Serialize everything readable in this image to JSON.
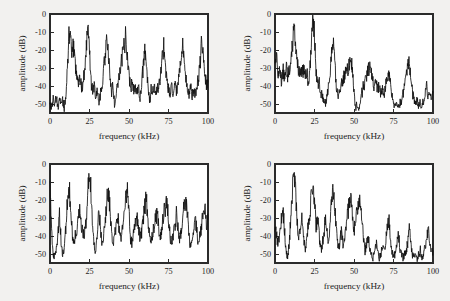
{
  "figure": {
    "background_color": "#f2f1ef",
    "panel_count": 4,
    "layout": "2x2-grid"
  },
  "axes": {
    "xlabel": "frequency (kHz)",
    "ylabel": "amplitude (dB)",
    "xticks": [
      "0",
      "25",
      "50",
      "75",
      "100"
    ],
    "xtick_values": [
      0,
      25,
      50,
      75,
      100
    ],
    "yticks": [
      "0",
      "-10",
      "-20",
      "-30",
      "-40",
      "-50"
    ],
    "ytick_values": [
      0,
      -10,
      -20,
      -30,
      -40,
      -50
    ],
    "xlim": [
      0,
      100
    ],
    "ylim": [
      -55,
      0
    ],
    "frame_color": "#2b2b2b",
    "trace_color": "#111111"
  },
  "chart_data": [
    {
      "type": "line",
      "title": "",
      "panel": "top-left",
      "xlabel": "frequency (kHz)",
      "ylabel": "amplitude (dB)",
      "xlim": [
        0,
        100
      ],
      "ylim": [
        -55,
        0
      ],
      "grid": false,
      "legend": "none",
      "peaks": [
        {
          "x": 12,
          "y": -10.5
        },
        {
          "x": 24,
          "y": 0
        },
        {
          "x": 36,
          "y": -14
        },
        {
          "x": 48,
          "y": -12
        },
        {
          "x": 60,
          "y": -20
        },
        {
          "x": 72,
          "y": -17
        },
        {
          "x": 84,
          "y": -18
        },
        {
          "x": 96,
          "y": -15
        }
      ],
      "noise_floor": -44,
      "x": [
        0,
        1,
        2,
        3,
        4,
        5,
        6,
        7,
        8,
        9,
        10,
        11,
        12,
        13,
        14,
        15,
        16,
        17,
        18,
        19,
        20,
        21,
        22,
        23,
        24,
        25,
        26,
        27,
        28,
        29,
        30,
        31,
        32,
        33,
        34,
        35,
        36,
        37,
        38,
        39,
        40,
        41,
        42,
        43,
        44,
        45,
        46,
        47,
        48,
        49,
        50,
        51,
        52,
        53,
        54,
        55,
        56,
        57,
        58,
        59,
        60,
        61,
        62,
        63,
        64,
        65,
        66,
        67,
        68,
        69,
        70,
        71,
        72,
        73,
        74,
        75,
        76,
        77,
        78,
        79,
        80,
        81,
        82,
        83,
        84,
        85,
        86,
        87,
        88,
        89,
        90,
        91,
        92,
        93,
        94,
        95,
        96,
        97,
        98,
        99,
        100
      ],
      "values": [
        -49,
        -52,
        -47,
        -50,
        -46,
        -52,
        -47,
        -51,
        -48,
        -53,
        -45,
        -30,
        -10.5,
        -17,
        -22,
        -18,
        -28,
        -33,
        -38,
        -36,
        -41,
        -38,
        -30,
        -18,
        0,
        -22,
        -38,
        -42,
        -40,
        -46,
        -42,
        -50,
        -44,
        -39,
        -30,
        -22,
        -14,
        -24,
        -34,
        -43,
        -40,
        -52,
        -43,
        -38,
        -33,
        -28,
        -22,
        -18,
        -12,
        -22,
        -34,
        -41,
        -38,
        -43,
        -40,
        -44,
        -41,
        -47,
        -38,
        -30,
        -20,
        -30,
        -38,
        -50,
        -42,
        -44,
        -40,
        -45,
        -42,
        -40,
        -34,
        -24,
        -17,
        -28,
        -38,
        -42,
        -45,
        -41,
        -44,
        -40,
        -43,
        -40,
        -33,
        -24,
        -18,
        -26,
        -36,
        -42,
        -44,
        -41,
        -45,
        -42,
        -44,
        -40,
        -36,
        -28,
        -15,
        -24,
        -34,
        -39,
        -38
      ]
    },
    {
      "type": "line",
      "title": "",
      "panel": "top-right",
      "xlabel": "frequency (kHz)",
      "ylabel": "amplitude (dB)",
      "xlim": [
        0,
        100
      ],
      "ylim": [
        -55,
        0
      ],
      "grid": false,
      "legend": "none",
      "peaks": [
        {
          "x": 12,
          "y": -6
        },
        {
          "x": 24,
          "y": 0
        },
        {
          "x": 37,
          "y": -18
        },
        {
          "x": 48,
          "y": -24
        },
        {
          "x": 60,
          "y": -30
        },
        {
          "x": 72,
          "y": -32
        },
        {
          "x": 85,
          "y": -28
        }
      ],
      "noise_floor": -46,
      "x": [
        0,
        1,
        2,
        3,
        4,
        5,
        6,
        7,
        8,
        9,
        10,
        11,
        12,
        13,
        14,
        15,
        16,
        17,
        18,
        19,
        20,
        21,
        22,
        23,
        24,
        25,
        26,
        27,
        28,
        29,
        30,
        31,
        32,
        33,
        34,
        35,
        36,
        37,
        38,
        39,
        40,
        41,
        42,
        43,
        44,
        45,
        46,
        47,
        48,
        49,
        50,
        51,
        52,
        53,
        54,
        55,
        56,
        57,
        58,
        59,
        60,
        61,
        62,
        63,
        64,
        65,
        66,
        67,
        68,
        69,
        70,
        71,
        72,
        73,
        74,
        75,
        76,
        77,
        78,
        79,
        80,
        81,
        82,
        83,
        84,
        85,
        86,
        87,
        88,
        89,
        90,
        91,
        92,
        93,
        94,
        95,
        96,
        97,
        98,
        99,
        100
      ],
      "values": [
        -31,
        -24,
        -32,
        -29,
        -37,
        -31,
        -35,
        -30,
        -34,
        -31,
        -29,
        -17,
        -6,
        -17,
        -28,
        -32,
        -30,
        -33,
        -31,
        -35,
        -32,
        -37,
        -33,
        -14,
        0,
        -12,
        -30,
        -40,
        -38,
        -44,
        -46,
        -48,
        -50,
        -45,
        -40,
        -30,
        -22,
        -18,
        -30,
        -42,
        -46,
        -42,
        -38,
        -36,
        -34,
        -33,
        -31,
        -28,
        -24,
        -32,
        -44,
        -52,
        -50,
        -53,
        -48,
        -44,
        -40,
        -38,
        -34,
        -31,
        -30,
        -34,
        -38,
        -40,
        -38,
        -42,
        -40,
        -44,
        -41,
        -45,
        -40,
        -36,
        -32,
        -38,
        -44,
        -50,
        -52,
        -50,
        -53,
        -50,
        -48,
        -44,
        -40,
        -34,
        -30,
        -28,
        -36,
        -44,
        -48,
        -50,
        -48,
        -51,
        -49,
        -52,
        -48,
        -44,
        -40,
        -46,
        -42,
        -48,
        -44
      ]
    },
    {
      "type": "line",
      "title": "",
      "panel": "bottom-left",
      "xlabel": "frequency (kHz)",
      "ylabel": "amplitude (dB)",
      "xlim": [
        0,
        100
      ],
      "ylim": [
        -55,
        0
      ],
      "grid": false,
      "legend": "none",
      "peaks": [
        {
          "x": 0,
          "y": -9
        },
        {
          "x": 6,
          "y": -28
        },
        {
          "x": 12,
          "y": -10.5
        },
        {
          "x": 19,
          "y": -24
        },
        {
          "x": 25,
          "y": -2
        },
        {
          "x": 31,
          "y": -26
        },
        {
          "x": 37,
          "y": -13
        },
        {
          "x": 43,
          "y": -29
        },
        {
          "x": 49,
          "y": -16
        },
        {
          "x": 55,
          "y": -27
        },
        {
          "x": 61,
          "y": -19
        },
        {
          "x": 68,
          "y": -28
        },
        {
          "x": 74,
          "y": -20
        },
        {
          "x": 80,
          "y": -28
        },
        {
          "x": 86,
          "y": -19
        },
        {
          "x": 92,
          "y": -30
        },
        {
          "x": 98,
          "y": -25
        }
      ],
      "noise_floor": -40,
      "x": [
        0,
        1,
        2,
        3,
        4,
        5,
        6,
        7,
        8,
        9,
        10,
        11,
        12,
        13,
        14,
        15,
        16,
        17,
        18,
        19,
        20,
        21,
        22,
        23,
        24,
        25,
        26,
        27,
        28,
        29,
        30,
        31,
        32,
        33,
        34,
        35,
        36,
        37,
        38,
        39,
        40,
        41,
        42,
        43,
        44,
        45,
        46,
        47,
        48,
        49,
        50,
        51,
        52,
        53,
        54,
        55,
        56,
        57,
        58,
        59,
        60,
        61,
        62,
        63,
        64,
        65,
        66,
        67,
        68,
        69,
        70,
        71,
        72,
        73,
        74,
        75,
        76,
        77,
        78,
        79,
        80,
        81,
        82,
        83,
        84,
        85,
        86,
        87,
        88,
        89,
        90,
        91,
        92,
        93,
        94,
        95,
        96,
        97,
        98,
        99,
        100
      ],
      "values": [
        -9,
        -38,
        -50,
        -52,
        -48,
        -40,
        -28,
        -42,
        -50,
        -46,
        -36,
        -22,
        -10.5,
        -24,
        -38,
        -44,
        -40,
        -36,
        -30,
        -24,
        -34,
        -40,
        -38,
        -30,
        -14,
        -2,
        -16,
        -34,
        -46,
        -50,
        -38,
        -26,
        -36,
        -44,
        -40,
        -30,
        -20,
        -13,
        -26,
        -38,
        -44,
        -40,
        -34,
        -29,
        -38,
        -42,
        -36,
        -28,
        -20,
        -16,
        -28,
        -42,
        -44,
        -38,
        -32,
        -27,
        -36,
        -42,
        -38,
        -30,
        -24,
        -19,
        -30,
        -40,
        -43,
        -38,
        -34,
        -30,
        -28,
        -38,
        -40,
        -34,
        -28,
        -24,
        -20,
        -30,
        -40,
        -44,
        -40,
        -34,
        -28,
        -36,
        -42,
        -38,
        -28,
        -22,
        -19,
        -28,
        -40,
        -46,
        -44,
        -38,
        -30,
        -38,
        -44,
        -40,
        -34,
        -28,
        -25,
        -34,
        -31
      ]
    },
    {
      "type": "line",
      "title": "",
      "panel": "bottom-right",
      "xlabel": "frequency (kHz)",
      "ylabel": "amplitude (dB)",
      "xlim": [
        0,
        100
      ],
      "ylim": [
        -55,
        0
      ],
      "grid": false,
      "legend": "none",
      "peaks": [
        {
          "x": 12,
          "y": -2
        },
        {
          "x": 24,
          "y": -10
        },
        {
          "x": 37,
          "y": -14
        },
        {
          "x": 48,
          "y": -18
        },
        {
          "x": 54,
          "y": -22
        },
        {
          "x": 72,
          "y": -30
        },
        {
          "x": 78,
          "y": -38
        },
        {
          "x": 85,
          "y": -36
        },
        {
          "x": 97,
          "y": -35
        }
      ],
      "noise_floor": -48,
      "x": [
        0,
        1,
        2,
        3,
        4,
        5,
        6,
        7,
        8,
        9,
        10,
        11,
        12,
        13,
        14,
        15,
        16,
        17,
        18,
        19,
        20,
        21,
        22,
        23,
        24,
        25,
        26,
        27,
        28,
        29,
        30,
        31,
        32,
        33,
        34,
        35,
        36,
        37,
        38,
        39,
        40,
        41,
        42,
        43,
        44,
        45,
        46,
        47,
        48,
        49,
        50,
        51,
        52,
        53,
        54,
        55,
        56,
        57,
        58,
        59,
        60,
        61,
        62,
        63,
        64,
        65,
        66,
        67,
        68,
        69,
        70,
        71,
        72,
        73,
        74,
        75,
        76,
        77,
        78,
        79,
        80,
        81,
        82,
        83,
        84,
        85,
        86,
        87,
        88,
        89,
        90,
        91,
        92,
        93,
        94,
        95,
        96,
        97,
        98,
        99,
        100
      ],
      "values": [
        -34,
        -40,
        -44,
        -38,
        -30,
        -25,
        -36,
        -48,
        -52,
        -44,
        -30,
        -14,
        -2,
        -16,
        -30,
        -42,
        -36,
        -28,
        -38,
        -48,
        -44,
        -34,
        -28,
        -18,
        -10,
        -22,
        -34,
        -30,
        -40,
        -48,
        -44,
        -38,
        -30,
        -38,
        -44,
        -28,
        -18,
        -14,
        -26,
        -38,
        -46,
        -44,
        -38,
        -44,
        -40,
        -34,
        -28,
        -22,
        -18,
        -28,
        -38,
        -32,
        -26,
        -23,
        -22,
        -30,
        -42,
        -48,
        -44,
        -40,
        -46,
        -50,
        -52,
        -48,
        -44,
        -48,
        -52,
        -50,
        -46,
        -48,
        -44,
        -36,
        -30,
        -40,
        -48,
        -52,
        -50,
        -44,
        -38,
        -46,
        -50,
        -52,
        -50,
        -48,
        -44,
        -36,
        -44,
        -50,
        -52,
        -50,
        -53,
        -50,
        -48,
        -52,
        -50,
        -46,
        -42,
        -35,
        -44,
        -50,
        -48
      ]
    }
  ]
}
